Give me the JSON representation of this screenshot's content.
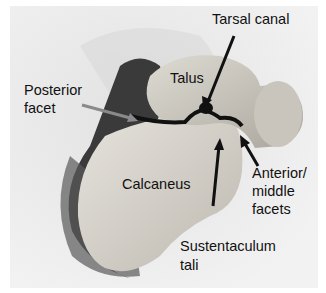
{
  "figure": {
    "labels": {
      "tarsal_canal": "Tarsal canal",
      "talus": "Talus",
      "posterior_facet_line1": "Posterior",
      "posterior_facet_line2": "facet",
      "calcaneus": "Calcaneus",
      "anterior_line1": "Anterior/",
      "anterior_line2": "middle",
      "anterior_line3": "facets",
      "sustentaculum_line1": "Sustentaculum",
      "sustentaculum_line2": "tali"
    },
    "colors": {
      "background": "#ededed",
      "bone": "#d6d3cc",
      "shadow": "#3c3c3c",
      "arrow": "#111111",
      "posterior_arrow": "#8a8a8a"
    }
  }
}
